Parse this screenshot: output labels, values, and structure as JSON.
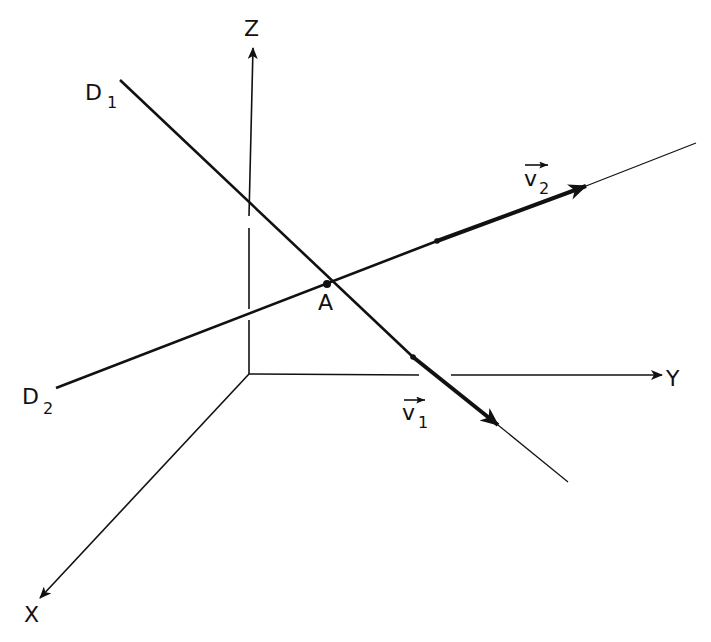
{
  "diagram": {
    "type": "3d-coordinate-lines",
    "colors": {
      "ink": "#111111",
      "background": "#ffffff"
    },
    "axes": {
      "origin": [
        249,
        374
      ],
      "z": {
        "label": "Z",
        "tip": [
          253,
          48
        ],
        "label_pos": [
          244,
          36
        ]
      },
      "y": {
        "label": "Y",
        "tip": [
          662,
          375
        ],
        "label_pos": [
          666,
          386
        ]
      },
      "x": {
        "label": "X",
        "tip": [
          40,
          598
        ],
        "label_pos": [
          24,
          622
        ]
      }
    },
    "lines": [
      {
        "name": "D1",
        "label": "D",
        "subscript": "1",
        "start": [
          120,
          80
        ],
        "end": [
          568,
          482
        ],
        "label_pos": [
          85,
          100
        ]
      },
      {
        "name": "D2",
        "label": "D",
        "subscript": "2",
        "start": [
          56,
          388
        ],
        "end": [
          696,
          143
        ],
        "label_pos": [
          22,
          404
        ]
      }
    ],
    "intersection": {
      "label": "A",
      "point": [
        327,
        284
      ],
      "label_pos": [
        318,
        310
      ]
    },
    "vectors": [
      {
        "name": "v1",
        "label": "v",
        "subscript": "1",
        "start": [
          413,
          357
        ],
        "tip": [
          498,
          425
        ],
        "label_pos": [
          402,
          420
        ]
      },
      {
        "name": "v2",
        "label": "v",
        "subscript": "2",
        "start": [
          437,
          241
        ],
        "tip": [
          586,
          186
        ],
        "label_pos": [
          512,
          188
        ]
      }
    ]
  }
}
